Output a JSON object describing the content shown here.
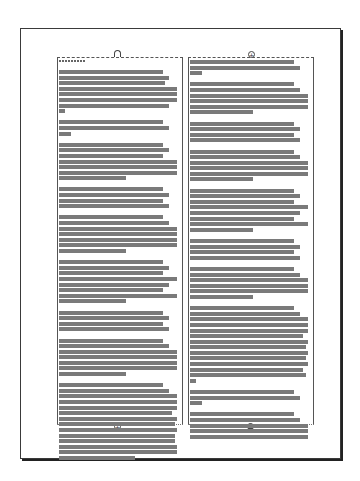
{
  "document": {
    "page": {
      "label": "page-1",
      "columns": 2
    },
    "frames": [
      {
        "id": "left",
        "greeked": true,
        "ports": {
          "in": "empty-port",
          "out": "linked-out-port"
        },
        "paragraphs": [
          [
            0.85,
            0.9,
            0.87,
            0.97,
            0.97,
            0.97,
            0.9,
            0.05
          ],
          [
            0.85,
            0.9,
            0.1
          ],
          [
            0.85,
            0.9,
            0.85,
            0.97,
            0.97,
            0.97,
            0.55
          ],
          [
            0.85,
            0.9,
            0.85,
            0.9
          ],
          [
            0.85,
            0.9,
            0.97,
            0.97,
            0.97,
            0.97,
            0.55
          ],
          [
            0.85,
            0.9,
            0.85,
            0.97,
            0.9,
            0.85,
            0.97,
            0.55
          ],
          [
            0.85,
            0.9,
            0.85,
            0.9
          ],
          [
            0.85,
            0.9,
            0.97,
            0.97,
            0.97,
            0.97,
            0.55
          ],
          [
            0.85,
            0.9,
            0.97,
            0.97,
            0.97,
            0.93,
            0.97,
            0.95,
            0.97,
            0.95,
            0.95,
            0.97,
            0.97,
            0.62
          ]
        ]
      },
      {
        "id": "right",
        "greeked": true,
        "ports": {
          "in": "linked-in-port",
          "out": "overflow-out-port"
        },
        "paragraphs": [
          [
            0.85,
            0.9,
            0.1
          ],
          [
            0.85,
            0.9,
            0.97,
            0.97,
            0.97,
            0.52
          ],
          [
            0.85,
            0.9,
            0.85,
            0.9
          ],
          [
            0.85,
            0.9,
            0.97,
            0.97,
            0.97,
            0.52
          ],
          [
            0.85,
            0.9,
            0.85,
            0.97,
            0.9,
            0.85,
            0.97,
            0.52
          ],
          [
            0.85,
            0.9,
            0.85,
            0.9
          ],
          [
            0.85,
            0.9,
            0.97,
            0.97,
            0.97,
            0.52
          ],
          [
            0.85,
            0.9,
            0.97,
            0.97,
            0.97,
            0.93,
            0.97,
            0.95,
            0.97,
            0.95,
            0.97,
            0.93,
            0.95,
            0.05
          ],
          [
            0.85,
            0.9,
            0.1
          ],
          [
            0.85,
            0.9,
            0.97,
            0.97,
            0.97
          ]
        ]
      }
    ],
    "colors": {
      "greek_text": "#7a7a7a",
      "frame_border": "#555555",
      "page_border": "#3a3a3a"
    }
  }
}
